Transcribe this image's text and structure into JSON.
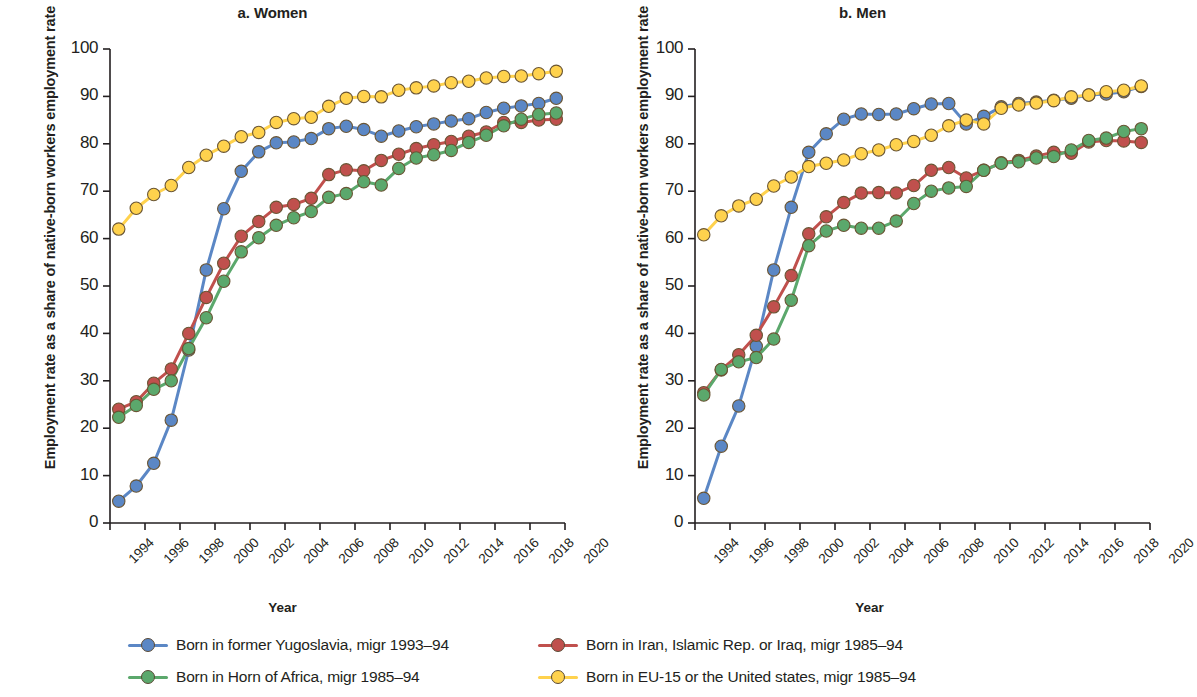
{
  "figure": {
    "panels": [
      {
        "title": "a. Women",
        "ylabel": "Employment rate as a share of native-born workers employment rate",
        "xlabel": "Year"
      },
      {
        "title": "b. Men",
        "ylabel": "Employment rate as a share of native-born workers employment rate",
        "xlabel": "Year"
      }
    ],
    "legend": [
      {
        "label": "Born in former Yugoslavia, migr 1993–94",
        "color": "#5B87C5"
      },
      {
        "label": "Born in Iran, Islamic Rep. or Iraq, migr 1985–94",
        "color": "#C0504D"
      },
      {
        "label": "Born in Horn of Africa, migr 1985–94",
        "color": "#5BA86C"
      },
      {
        "label": "Born in EU-15 or the United states, migr 1985–94",
        "color": "#FFD24D"
      }
    ]
  },
  "chart_data": [
    {
      "type": "line",
      "title": "a. Women",
      "xlabel": "Year",
      "ylabel": "Employment rate as a share of native-born workers employment rate",
      "xlim": [
        1994,
        2020
      ],
      "ylim": [
        0,
        100
      ],
      "xticks": [
        1994,
        1996,
        1998,
        2000,
        2002,
        2004,
        2006,
        2008,
        2010,
        2012,
        2014,
        2016,
        2018,
        2020
      ],
      "yticks": [
        0,
        10,
        20,
        30,
        40,
        50,
        60,
        70,
        80,
        90,
        100
      ],
      "grid": false,
      "legend_position": "bottom",
      "x": [
        1994.5,
        1995.5,
        1996.5,
        1997.5,
        1998.5,
        1999.5,
        2000.5,
        2001.5,
        2002.5,
        2003.5,
        2004.5,
        2005.5,
        2006.5,
        2007.5,
        2008.5,
        2009.5,
        2010.5,
        2011.5,
        2012.5,
        2013.5,
        2014.5,
        2015.5,
        2016.5,
        2017.5,
        2018.5,
        2019.5
      ],
      "series": [
        {
          "name": "Born in former Yugoslavia, migr 1993–94",
          "color": "#5B87C5",
          "values": [
            4.6,
            7.8,
            12.6,
            21.7,
            36.5,
            53.4,
            66.3,
            74.2,
            78.3,
            80.2,
            80.4,
            81.1,
            83.2,
            83.7,
            83.0,
            81.6,
            82.7,
            83.6,
            84.2,
            84.8,
            85.3,
            86.6,
            87.5,
            88.0,
            88.5,
            89.6
          ]
        },
        {
          "name": "Born in Iran, Islamic Rep. or Iraq, migr 1985–94",
          "color": "#C0504D",
          "values": [
            24.0,
            25.6,
            29.5,
            32.5,
            40.0,
            47.6,
            54.8,
            60.5,
            63.6,
            66.6,
            67.2,
            68.5,
            73.5,
            74.5,
            74.3,
            76.5,
            77.8,
            79.0,
            79.8,
            80.5,
            81.6,
            82.5,
            84.5,
            84.5,
            85.0,
            85.2
          ]
        },
        {
          "name": "Born in Horn of Africa, migr 1985–94",
          "color": "#5BA86C",
          "values": [
            22.3,
            24.8,
            28.2,
            30.0,
            36.8,
            43.3,
            51.0,
            57.2,
            60.2,
            62.8,
            64.4,
            65.7,
            68.7,
            69.5,
            72.0,
            71.3,
            74.8,
            77.0,
            77.7,
            78.6,
            80.3,
            81.8,
            83.8,
            85.2,
            86.2,
            86.5
          ]
        },
        {
          "name": "Born in EU-15 or the United states, migr 1985–94",
          "color": "#FFD24D",
          "values": [
            62.0,
            66.4,
            69.3,
            71.2,
            75.0,
            77.6,
            79.5,
            81.5,
            82.4,
            84.5,
            85.3,
            85.6,
            87.9,
            89.6,
            90.0,
            89.9,
            91.3,
            91.8,
            92.2,
            92.9,
            93.2,
            93.9,
            94.2,
            94.3,
            94.8,
            95.3
          ]
        }
      ]
    },
    {
      "type": "line",
      "title": "b. Men",
      "xlabel": "Year",
      "ylabel": "Employment rate as a share of native-born workers employment rate",
      "xlim": [
        1994,
        2020
      ],
      "ylim": [
        0,
        100
      ],
      "xticks": [
        1994,
        1996,
        1998,
        2000,
        2002,
        2004,
        2006,
        2008,
        2010,
        2012,
        2014,
        2016,
        2018,
        2020
      ],
      "yticks": [
        0,
        10,
        20,
        30,
        40,
        50,
        60,
        70,
        80,
        90,
        100
      ],
      "grid": false,
      "legend_position": "bottom",
      "x": [
        1994.5,
        1995.5,
        1996.5,
        1997.5,
        1998.5,
        1999.5,
        2000.5,
        2001.5,
        2002.5,
        2003.5,
        2004.5,
        2005.5,
        2006.5,
        2007.5,
        2008.5,
        2009.5,
        2010.5,
        2011.5,
        2012.5,
        2013.5,
        2014.5,
        2015.5,
        2016.5,
        2017.5,
        2018.5,
        2019.5
      ],
      "series": [
        {
          "name": "Born in former Yugoslavia, migr 1993–94",
          "color": "#5B87C5",
          "values": [
            5.2,
            16.2,
            24.7,
            37.3,
            53.4,
            66.6,
            78.2,
            82.1,
            85.2,
            86.3,
            86.2,
            86.3,
            87.4,
            88.4,
            88.5,
            84.2,
            85.8,
            87.8,
            88.5,
            88.8,
            89.2,
            89.6,
            90.3,
            90.5,
            91.0,
            92.1
          ]
        },
        {
          "name": "Born in Iran, Islamic Rep. or Iraq, migr 1985–94",
          "color": "#C0504D",
          "values": [
            27.5,
            32.3,
            35.5,
            39.6,
            45.6,
            52.2,
            61.0,
            64.6,
            67.6,
            69.6,
            69.7,
            69.6,
            71.2,
            74.4,
            75.0,
            72.8,
            74.4,
            76.0,
            76.5,
            77.4,
            78.2,
            78.0,
            80.4,
            80.7,
            80.6,
            80.3
          ]
        },
        {
          "name": "Born in Horn of Africa, migr 1985–94",
          "color": "#5BA86C",
          "values": [
            27.0,
            32.4,
            34.0,
            34.9,
            38.8,
            47.0,
            58.5,
            61.6,
            62.8,
            62.2,
            62.2,
            63.7,
            67.4,
            70.0,
            70.7,
            71.0,
            74.4,
            75.9,
            76.2,
            77.0,
            77.3,
            78.7,
            80.7,
            81.2,
            82.6,
            83.2
          ]
        },
        {
          "name": "Born in EU-15 or the United states, migr 1985–94",
          "color": "#FFD24D",
          "values": [
            60.8,
            64.8,
            66.9,
            68.3,
            71.1,
            73.0,
            75.2,
            75.9,
            76.6,
            77.9,
            78.7,
            79.8,
            80.5,
            81.8,
            83.8,
            85.0,
            84.2,
            87.5,
            88.2,
            88.6,
            89.1,
            89.9,
            90.3,
            91.0,
            91.3,
            92.2
          ]
        }
      ]
    }
  ]
}
